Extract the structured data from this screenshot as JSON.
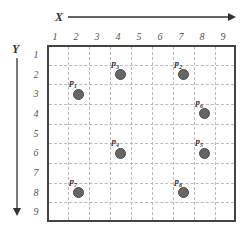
{
  "axes": {
    "x_label": "X",
    "y_label": "Y",
    "x_ticks": [
      "1",
      "2",
      "3",
      "4",
      "5",
      "6",
      "7",
      "8",
      "9"
    ],
    "y_ticks": [
      "1",
      "2",
      "3",
      "4",
      "5",
      "6",
      "7",
      "8",
      "9"
    ]
  },
  "points": [
    {
      "name": "p",
      "sub": "1",
      "x": 2,
      "y": 3
    },
    {
      "name": "p",
      "sub": "3",
      "x": 4,
      "y": 2
    },
    {
      "name": "p",
      "sub": "2",
      "x": 7,
      "y": 2
    },
    {
      "name": "p",
      "sub": "6",
      "x": 8,
      "y": 4
    },
    {
      "name": "p",
      "sub": "4",
      "x": 4,
      "y": 6
    },
    {
      "name": "p",
      "sub": "5",
      "x": 8,
      "y": 6
    },
    {
      "name": "p",
      "sub": "7",
      "x": 2,
      "y": 8
    },
    {
      "name": "p",
      "sub": "8",
      "x": 7,
      "y": 8
    }
  ],
  "colors": {
    "point_fill": "#666666",
    "grid_border": "#444444",
    "grid_dash": "#bbbbbb"
  }
}
